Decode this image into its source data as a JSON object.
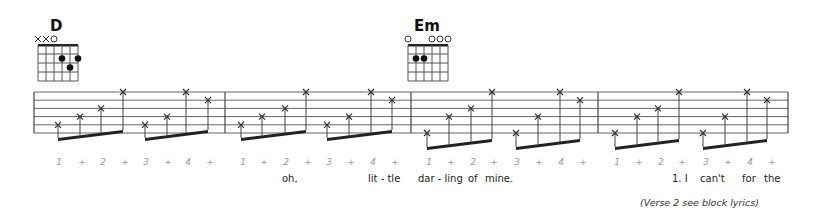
{
  "chords": [
    {
      "name": "D",
      "x": 38,
      "open_mute": [
        "x",
        "x",
        "o",
        "",
        "",
        ""
      ],
      "dots": [
        {
          "string": 4,
          "fret": 2
        },
        {
          "string": 6,
          "fret": 2
        },
        {
          "string": 5,
          "fret": 3
        }
      ]
    },
    {
      "name": "Em",
      "x": 408,
      "open_mute": [
        "o",
        "",
        "",
        "o",
        "o",
        "o"
      ],
      "dots": [
        {
          "string": 2,
          "fret": 2
        },
        {
          "string": 3,
          "fret": 2
        }
      ]
    }
  ],
  "staff": {
    "left": 34,
    "right": 788,
    "top": 92,
    "line_spacing": 8.2,
    "lines": 6,
    "barlines": [
      225,
      411,
      598
    ]
  },
  "notes": [
    {
      "x": 58,
      "s": 5
    },
    {
      "x": 80,
      "s": 4
    },
    {
      "x": 101,
      "s": 3
    },
    {
      "x": 123,
      "s": 1
    },
    {
      "x": 145,
      "s": 5
    },
    {
      "x": 167,
      "s": 4
    },
    {
      "x": 186,
      "s": 1
    },
    {
      "x": 208,
      "s": 2
    },
    {
      "x": 241,
      "s": 5
    },
    {
      "x": 262,
      "s": 4
    },
    {
      "x": 285,
      "s": 3
    },
    {
      "x": 306,
      "s": 1
    },
    {
      "x": 327,
      "s": 5
    },
    {
      "x": 349,
      "s": 4
    },
    {
      "x": 371,
      "s": 1
    },
    {
      "x": 392,
      "s": 2
    },
    {
      "x": 427,
      "s": 6
    },
    {
      "x": 449,
      "s": 4
    },
    {
      "x": 471,
      "s": 3
    },
    {
      "x": 492,
      "s": 1
    },
    {
      "x": 516,
      "s": 6
    },
    {
      "x": 538,
      "s": 4
    },
    {
      "x": 560,
      "s": 1
    },
    {
      "x": 580,
      "s": 2
    },
    {
      "x": 615,
      "s": 6
    },
    {
      "x": 637,
      "s": 4
    },
    {
      "x": 658,
      "s": 3
    },
    {
      "x": 679,
      "s": 1
    },
    {
      "x": 703,
      "s": 6
    },
    {
      "x": 725,
      "s": 4
    },
    {
      "x": 747,
      "s": 1
    },
    {
      "x": 767,
      "s": 2
    }
  ],
  "counting": [
    {
      "t": "1",
      "x": 59
    },
    {
      "t": "+",
      "x": 82
    },
    {
      "t": "2",
      "x": 103
    },
    {
      "t": "+",
      "x": 125
    },
    {
      "t": "3",
      "x": 146
    },
    {
      "t": "+",
      "x": 168
    },
    {
      "t": "4",
      "x": 188
    },
    {
      "t": "+",
      "x": 210
    },
    {
      "t": "1",
      "x": 243
    },
    {
      "t": "+",
      "x": 264
    },
    {
      "t": "2",
      "x": 286
    },
    {
      "t": "+",
      "x": 308
    },
    {
      "t": "3",
      "x": 329
    },
    {
      "t": "+",
      "x": 351
    },
    {
      "t": "4",
      "x": 373
    },
    {
      "t": "+",
      "x": 395
    },
    {
      "t": "1",
      "x": 429
    },
    {
      "t": "+",
      "x": 451
    },
    {
      "t": "2",
      "x": 473
    },
    {
      "t": "+",
      "x": 494
    },
    {
      "t": "3",
      "x": 517
    },
    {
      "t": "+",
      "x": 539
    },
    {
      "t": "4",
      "x": 561
    },
    {
      "t": "+",
      "x": 583
    },
    {
      "t": "1",
      "x": 617
    },
    {
      "t": "+",
      "x": 639
    },
    {
      "t": "2",
      "x": 661
    },
    {
      "t": "+",
      "x": 682
    },
    {
      "t": "3",
      "x": 706
    },
    {
      "t": "+",
      "x": 728
    },
    {
      "t": "4",
      "x": 750
    },
    {
      "t": "+",
      "x": 772
    }
  ],
  "lyrics": [
    {
      "t": "oh,",
      "x": 282
    },
    {
      "t": "lit - tle",
      "x": 368
    },
    {
      "t": "dar - ling",
      "x": 418
    },
    {
      "t": "of",
      "x": 468
    },
    {
      "t": "mine.",
      "x": 485
    },
    {
      "t": "1. I",
      "x": 672
    },
    {
      "t": "can't",
      "x": 700
    },
    {
      "t": "for",
      "x": 742
    },
    {
      "t": "the",
      "x": 764
    }
  ],
  "footnote": "(Verse 2 see block lyrics)"
}
